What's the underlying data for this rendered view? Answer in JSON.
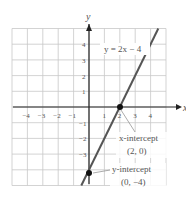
{
  "chart_data": {
    "type": "line",
    "title": "",
    "equation_label": "y = 2x − 4",
    "xlabel": "x",
    "ylabel": "y",
    "xlim": [
      -5,
      5
    ],
    "ylim": [
      -5,
      5
    ],
    "grid": true,
    "x_ticks": [
      "-4",
      "-3",
      "-2",
      "-1",
      "1",
      "2",
      "3",
      "4"
    ],
    "y_ticks": [
      "4",
      "3",
      "2",
      "1",
      "-1",
      "-2",
      "-3"
    ],
    "series": [
      {
        "name": "y = 2x − 4",
        "x": [
          -0.5,
          4.5
        ],
        "y": [
          -5,
          5
        ],
        "color": "#555555"
      }
    ],
    "points": [
      {
        "name": "x-intercept",
        "x": 2,
        "y": 0
      },
      {
        "name": "y-intercept",
        "x": 0,
        "y": -4
      }
    ],
    "annotations": {
      "x_intercept_label": "x-intercept",
      "x_intercept_coords": "(2, 0)",
      "y_intercept_label": "y-intercept",
      "y_intercept_coords": "(0, −4)"
    }
  },
  "colors": {
    "grid": "#c8c8c8",
    "axis": "#222222",
    "line": "#555555",
    "text": "#666666"
  }
}
